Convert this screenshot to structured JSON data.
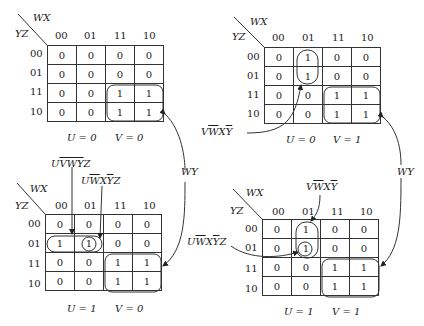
{
  "axis": {
    "col_var": "WX",
    "row_var": "YZ",
    "col_codes": [
      "00",
      "01",
      "11",
      "10"
    ],
    "row_codes": [
      "00",
      "01",
      "11",
      "10"
    ]
  },
  "maps": [
    {
      "id": "u0v0",
      "caption_u": "U = 0",
      "caption_v": "V = 0",
      "cells": [
        [
          "0",
          "0",
          "0",
          "0"
        ],
        [
          "0",
          "0",
          "0",
          "0"
        ],
        [
          "0",
          "0",
          "1",
          "1"
        ],
        [
          "0",
          "0",
          "1",
          "1"
        ]
      ]
    },
    {
      "id": "u0v1",
      "caption_u": "U = 0",
      "caption_v": "V = 1",
      "cells": [
        [
          "0",
          "1",
          "0",
          "0"
        ],
        [
          "0",
          "1",
          "0",
          "0"
        ],
        [
          "0",
          "0",
          "1",
          "1"
        ],
        [
          "0",
          "0",
          "1",
          "1"
        ]
      ]
    },
    {
      "id": "u1v0",
      "caption_u": "U = 1",
      "caption_v": "V = 0",
      "cells": [
        [
          "0",
          "0",
          "0",
          "0"
        ],
        [
          "1",
          "1",
          "0",
          "0"
        ],
        [
          "0",
          "0",
          "1",
          "1"
        ],
        [
          "0",
          "0",
          "1",
          "1"
        ]
      ]
    },
    {
      "id": "u1v1",
      "caption_u": "U = 1",
      "caption_v": "V = 1",
      "cells": [
        [
          "0",
          "1",
          "0",
          "0"
        ],
        [
          "0",
          "1",
          "0",
          "0"
        ],
        [
          "0",
          "0",
          "1",
          "1"
        ],
        [
          "0",
          "0",
          "1",
          "1"
        ]
      ]
    }
  ],
  "annotations": {
    "wy": "WY",
    "v_wbar_x_ybar": {
      "p1": "V",
      "p2": "W",
      "p3": "X",
      "p4": "Y"
    },
    "u_vbar_wbar_ybar_z": {
      "p1": "U",
      "p2": "V",
      "p3": "W",
      "p4": "Y",
      "p5": "Z"
    },
    "u_wbar_x_ybar_z": {
      "p1": "U",
      "p2": "W",
      "p3": "X",
      "p4": "Y",
      "p5": "Z"
    }
  }
}
